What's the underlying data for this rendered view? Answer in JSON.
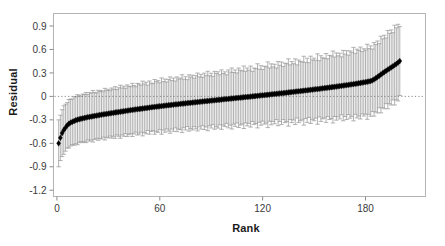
{
  "chart_data": {
    "type": "scatter",
    "title": "",
    "xlabel": "Rank",
    "ylabel": "Residual",
    "xlim": [
      -2,
      215
    ],
    "ylim": [
      -1.28,
      1.06
    ],
    "grid": false,
    "legend": null,
    "error_bars": true,
    "error_bar_style": "vertical-with-caps",
    "marker": "filled-diamond",
    "marker_color": "#000000",
    "error_bar_color": "#9a9a9a",
    "zero_reference_line": {
      "value": 0,
      "style": "dotted",
      "color": "#6e6e6e"
    },
    "xticks": [
      0,
      60,
      120,
      180
    ],
    "xticklabels": [
      "0",
      "60",
      "120",
      "180"
    ],
    "yticks": [
      0.9,
      0.6,
      0.3,
      0,
      -0.3,
      -0.6,
      -0.9,
      -1.2
    ],
    "yticklabels": [
      "0.9",
      "0.6",
      "0.3",
      "0",
      "-0.3",
      "-0.6",
      "-0.9",
      "-1.2"
    ],
    "n_points": 200,
    "x": [
      1,
      2,
      3,
      4,
      5,
      6,
      7,
      8,
      9,
      10,
      11,
      12,
      13,
      14,
      15,
      16,
      17,
      18,
      19,
      20,
      21,
      22,
      23,
      24,
      25,
      26,
      27,
      28,
      29,
      30,
      31,
      32,
      33,
      34,
      35,
      36,
      37,
      38,
      39,
      40,
      41,
      42,
      43,
      44,
      45,
      46,
      47,
      48,
      49,
      50,
      51,
      52,
      53,
      54,
      55,
      56,
      57,
      58,
      59,
      60,
      61,
      62,
      63,
      64,
      65,
      66,
      67,
      68,
      69,
      70,
      71,
      72,
      73,
      74,
      75,
      76,
      77,
      78,
      79,
      80,
      81,
      82,
      83,
      84,
      85,
      86,
      87,
      88,
      89,
      90,
      91,
      92,
      93,
      94,
      95,
      96,
      97,
      98,
      99,
      100,
      101,
      102,
      103,
      104,
      105,
      106,
      107,
      108,
      109,
      110,
      111,
      112,
      113,
      114,
      115,
      116,
      117,
      118,
      119,
      120,
      121,
      122,
      123,
      124,
      125,
      126,
      127,
      128,
      129,
      130,
      131,
      132,
      133,
      134,
      135,
      136,
      137,
      138,
      139,
      140,
      141,
      142,
      143,
      144,
      145,
      146,
      147,
      148,
      149,
      150,
      151,
      152,
      153,
      154,
      155,
      156,
      157,
      158,
      159,
      160,
      161,
      162,
      163,
      164,
      165,
      166,
      167,
      168,
      169,
      170,
      171,
      172,
      173,
      174,
      175,
      176,
      177,
      178,
      179,
      180,
      181,
      182,
      183,
      184,
      185,
      186,
      187,
      188,
      189,
      190,
      191,
      192,
      193,
      194,
      195,
      196,
      197,
      198,
      199,
      200
    ],
    "y": [
      -0.6,
      -0.53,
      -0.47,
      -0.43,
      -0.4,
      -0.37,
      -0.35,
      -0.335,
      -0.325,
      -0.315,
      -0.305,
      -0.298,
      -0.292,
      -0.286,
      -0.281,
      -0.276,
      -0.271,
      -0.266,
      -0.262,
      -0.258,
      -0.254,
      -0.25,
      -0.246,
      -0.242,
      -0.238,
      -0.234,
      -0.231,
      -0.227,
      -0.224,
      -0.22,
      -0.217,
      -0.213,
      -0.21,
      -0.206,
      -0.203,
      -0.2,
      -0.196,
      -0.193,
      -0.19,
      -0.186,
      -0.183,
      -0.18,
      -0.176,
      -0.173,
      -0.17,
      -0.167,
      -0.164,
      -0.161,
      -0.158,
      -0.155,
      -0.152,
      -0.149,
      -0.146,
      -0.143,
      -0.14,
      -0.137,
      -0.134,
      -0.132,
      -0.129,
      -0.126,
      -0.124,
      -0.121,
      -0.118,
      -0.116,
      -0.113,
      -0.111,
      -0.108,
      -0.106,
      -0.103,
      -0.101,
      -0.098,
      -0.096,
      -0.093,
      -0.091,
      -0.089,
      -0.086,
      -0.084,
      -0.082,
      -0.079,
      -0.077,
      -0.075,
      -0.072,
      -0.07,
      -0.068,
      -0.065,
      -0.063,
      -0.061,
      -0.059,
      -0.056,
      -0.054,
      -0.052,
      -0.05,
      -0.047,
      -0.045,
      -0.043,
      -0.041,
      -0.038,
      -0.036,
      -0.034,
      -0.032,
      -0.029,
      -0.027,
      -0.025,
      -0.023,
      -0.02,
      -0.018,
      -0.016,
      -0.014,
      -0.011,
      -0.009,
      -0.007,
      -0.005,
      -0.002,
      0.0,
      0.002,
      0.005,
      0.007,
      0.009,
      0.012,
      0.014,
      0.016,
      0.019,
      0.021,
      0.023,
      0.026,
      0.028,
      0.031,
      0.033,
      0.035,
      0.038,
      0.04,
      0.043,
      0.045,
      0.048,
      0.05,
      0.053,
      0.055,
      0.058,
      0.06,
      0.063,
      0.065,
      0.068,
      0.07,
      0.073,
      0.076,
      0.078,
      0.081,
      0.084,
      0.086,
      0.089,
      0.092,
      0.094,
      0.097,
      0.1,
      0.103,
      0.105,
      0.108,
      0.111,
      0.114,
      0.117,
      0.12,
      0.123,
      0.126,
      0.129,
      0.132,
      0.135,
      0.138,
      0.141,
      0.144,
      0.147,
      0.151,
      0.154,
      0.157,
      0.161,
      0.164,
      0.168,
      0.171,
      0.175,
      0.179,
      0.183,
      0.187,
      0.191,
      0.196,
      0.205,
      0.218,
      0.232,
      0.248,
      0.264,
      0.28,
      0.296,
      0.312,
      0.327,
      0.342,
      0.356,
      0.37,
      0.385,
      0.4,
      0.416,
      0.432,
      0.452,
      0.47,
      0.43
    ],
    "yerr_upper": [
      0.3,
      0.29,
      0.3,
      0.31,
      0.3,
      0.29,
      0.31,
      0.3,
      0.29,
      0.31,
      0.3,
      0.32,
      0.3,
      0.29,
      0.31,
      0.3,
      0.32,
      0.29,
      0.31,
      0.3,
      0.33,
      0.3,
      0.29,
      0.32,
      0.3,
      0.31,
      0.29,
      0.33,
      0.3,
      0.31,
      0.29,
      0.32,
      0.3,
      0.33,
      0.29,
      0.31,
      0.34,
      0.3,
      0.32,
      0.29,
      0.33,
      0.31,
      0.3,
      0.34,
      0.31,
      0.29,
      0.33,
      0.32,
      0.3,
      0.35,
      0.31,
      0.33,
      0.29,
      0.34,
      0.31,
      0.3,
      0.35,
      0.32,
      0.33,
      0.3,
      0.36,
      0.31,
      0.34,
      0.3,
      0.33,
      0.36,
      0.31,
      0.34,
      0.3,
      0.35,
      0.32,
      0.33,
      0.37,
      0.31,
      0.34,
      0.3,
      0.36,
      0.33,
      0.35,
      0.31,
      0.34,
      0.37,
      0.32,
      0.35,
      0.31,
      0.36,
      0.33,
      0.38,
      0.32,
      0.35,
      0.31,
      0.37,
      0.34,
      0.36,
      0.32,
      0.38,
      0.33,
      0.35,
      0.31,
      0.37,
      0.34,
      0.39,
      0.33,
      0.36,
      0.32,
      0.38,
      0.35,
      0.34,
      0.4,
      0.33,
      0.37,
      0.34,
      0.39,
      0.32,
      0.36,
      0.35,
      0.41,
      0.34,
      0.38,
      0.33,
      0.37,
      0.36,
      0.42,
      0.34,
      0.39,
      0.35,
      0.38,
      0.33,
      0.41,
      0.36,
      0.4,
      0.34,
      0.38,
      0.37,
      0.43,
      0.35,
      0.39,
      0.36,
      0.42,
      0.34,
      0.4,
      0.38,
      0.37,
      0.44,
      0.36,
      0.41,
      0.35,
      0.43,
      0.38,
      0.4,
      0.37,
      0.45,
      0.36,
      0.42,
      0.39,
      0.38,
      0.44,
      0.37,
      0.41,
      0.4,
      0.46,
      0.38,
      0.43,
      0.39,
      0.42,
      0.37,
      0.45,
      0.4,
      0.44,
      0.38,
      0.43,
      0.41,
      0.47,
      0.39,
      0.44,
      0.42,
      0.46,
      0.4,
      0.43,
      0.41,
      0.48,
      0.42,
      0.45,
      0.4,
      0.47,
      0.43,
      0.46,
      0.41,
      0.49,
      0.44,
      0.47,
      0.42,
      0.5,
      0.45,
      0.48,
      0.43,
      0.51,
      0.46,
      0.49,
      0.44,
      0.52,
      0.47,
      0.5,
      0.3
    ],
    "yerr_lower": [
      0.3,
      0.29,
      0.3,
      0.31,
      0.3,
      0.29,
      0.31,
      0.3,
      0.29,
      0.31,
      0.3,
      0.32,
      0.3,
      0.29,
      0.31,
      0.3,
      0.32,
      0.29,
      0.31,
      0.3,
      0.33,
      0.3,
      0.29,
      0.32,
      0.3,
      0.31,
      0.29,
      0.33,
      0.3,
      0.31,
      0.29,
      0.32,
      0.3,
      0.33,
      0.29,
      0.31,
      0.34,
      0.3,
      0.32,
      0.29,
      0.33,
      0.31,
      0.3,
      0.34,
      0.31,
      0.29,
      0.33,
      0.32,
      0.3,
      0.35,
      0.31,
      0.33,
      0.29,
      0.34,
      0.31,
      0.3,
      0.35,
      0.32,
      0.33,
      0.3,
      0.36,
      0.31,
      0.34,
      0.3,
      0.33,
      0.36,
      0.31,
      0.34,
      0.3,
      0.35,
      0.32,
      0.33,
      0.37,
      0.31,
      0.34,
      0.3,
      0.36,
      0.33,
      0.35,
      0.31,
      0.34,
      0.37,
      0.32,
      0.35,
      0.31,
      0.36,
      0.33,
      0.38,
      0.32,
      0.35,
      0.31,
      0.37,
      0.34,
      0.36,
      0.32,
      0.38,
      0.33,
      0.35,
      0.31,
      0.37,
      0.34,
      0.39,
      0.33,
      0.36,
      0.32,
      0.38,
      0.35,
      0.34,
      0.4,
      0.33,
      0.37,
      0.34,
      0.39,
      0.32,
      0.36,
      0.35,
      0.41,
      0.34,
      0.38,
      0.33,
      0.37,
      0.36,
      0.42,
      0.34,
      0.39,
      0.35,
      0.38,
      0.33,
      0.41,
      0.36,
      0.4,
      0.34,
      0.38,
      0.37,
      0.43,
      0.35,
      0.39,
      0.36,
      0.42,
      0.34,
      0.4,
      0.38,
      0.37,
      0.44,
      0.36,
      0.41,
      0.35,
      0.43,
      0.38,
      0.4,
      0.37,
      0.45,
      0.36,
      0.42,
      0.39,
      0.38,
      0.44,
      0.37,
      0.41,
      0.4,
      0.46,
      0.38,
      0.43,
      0.39,
      0.42,
      0.37,
      0.45,
      0.4,
      0.44,
      0.38,
      0.43,
      0.41,
      0.47,
      0.39,
      0.44,
      0.42,
      0.46,
      0.4,
      0.43,
      0.41,
      0.48,
      0.42,
      0.45,
      0.4,
      0.47,
      0.43,
      0.46,
      0.41,
      0.49,
      0.44,
      0.47,
      0.42,
      0.5,
      0.45,
      0.48,
      0.43,
      0.51,
      0.46,
      0.49,
      0.44,
      0.52,
      0.47,
      0.5,
      0.3
    ]
  },
  "axes": {
    "x_title": "Rank",
    "y_title": "Residual"
  },
  "colors": {
    "frame": "#b4b4b4",
    "tick": "#8c8c8c",
    "marker": "#000000",
    "error": "#9a9a9a",
    "zero_line": "#6e6e6e",
    "text": "#2a2a2a",
    "background": "#ffffff"
  }
}
